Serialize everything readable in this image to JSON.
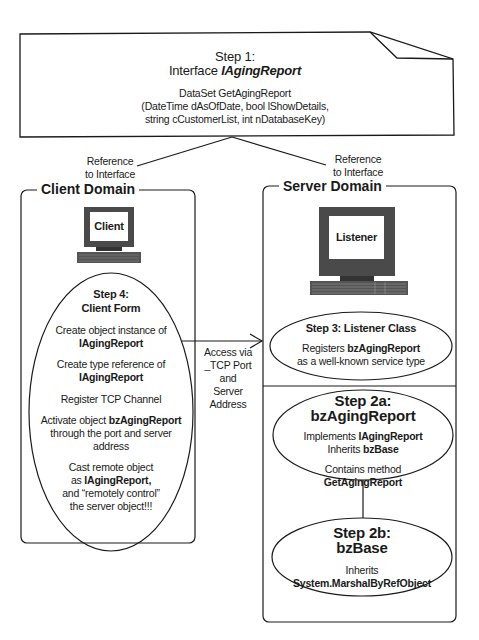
{
  "interface_box": {
    "step": "Step 1:",
    "title_prefix": "Interface ",
    "title_name": "IAgingReport",
    "signature_line1": "DataSet GetAgingReport",
    "signature_line2": "(DateTime dAsOfDate, bool lShowDetails,",
    "signature_line3": "string cCustomerList, int nDatabaseKey)"
  },
  "connectors": {
    "left_label_line1": "Reference",
    "left_label_line2": "to Interface",
    "right_label_line1": "Reference",
    "right_label_line2": "to Interface",
    "access_line1": "Access via",
    "access_line2": "_TCP Port and",
    "access_line3": "Server",
    "access_line4": "Address"
  },
  "client_domain": {
    "label": "Client Domain",
    "computer_label": "Client",
    "step": {
      "title1": "Step 4:",
      "title2": "Client Form",
      "items": [
        {
          "pre": "Create object instance of",
          "bold": "IAgingReport"
        },
        {
          "pre": "Create type reference of",
          "bold": "IAgingReport"
        },
        {
          "pre": "Register TCP Channel"
        },
        {
          "pre": "Activate object ",
          "bold": "bzAgingReport",
          "post1": "through the port and server",
          "post2": "address"
        },
        {
          "pre": "Cast remote object",
          "pre2": "as ",
          "bold": "IAgingReport,",
          "post1": "and “remotely control”",
          "post2": "the server object!!!"
        }
      ]
    }
  },
  "server_domain": {
    "label": "Server Domain",
    "computer_label": "Listener",
    "step3": {
      "title": "Step 3: Listener Class",
      "line1_pre": "Registers ",
      "line1_bold": "bzAgingReport",
      "line2": "as a well-known service type"
    },
    "step2a": {
      "title1": "Step 2a:",
      "title2": "bzAgingReport",
      "line1_pre": "Implements ",
      "line1_bold": "IAgingReport",
      "line2_pre": "Inherits ",
      "line2_bold": "bzBase",
      "line3": "Contains method",
      "line4_bold": "GetAgingReport"
    },
    "step2b": {
      "title1": "Step 2b:",
      "title2": "bzBase",
      "line1": "Inherits",
      "line2_bold": "System.MarshalByRefObject"
    }
  },
  "colors": {
    "stroke": "#1a1a1a",
    "monitor_frame": "#4a4a4a",
    "keyboard": "#555555"
  }
}
